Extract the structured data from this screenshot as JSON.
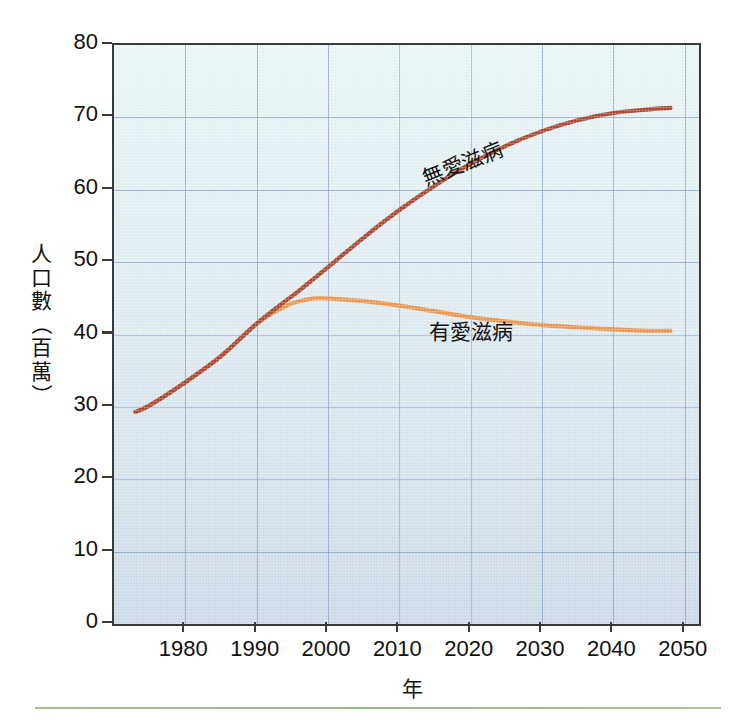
{
  "chart_data": {
    "type": "line",
    "title": "",
    "xlabel": "年",
    "ylabel": "人口數（百萬）",
    "xlim": [
      1973,
      2050
    ],
    "ylim": [
      0,
      80
    ],
    "xticks": [
      "1980",
      "1990",
      "2000",
      "2010",
      "2020",
      "2030",
      "2040",
      "2050"
    ],
    "yticks": [
      "0",
      "10",
      "20",
      "30",
      "40",
      "50",
      "60",
      "70",
      "80"
    ],
    "grid": true,
    "legend_position": "inline-annotation",
    "series": [
      {
        "name": "無愛滋病",
        "color": "#a8452f",
        "x": [
          1973,
          1975,
          1980,
          1985,
          1990,
          1994,
          1996,
          2000,
          2005,
          2010,
          2015,
          2020,
          2025,
          2030,
          2035,
          2040,
          2045,
          2048
        ],
        "values": [
          29.3,
          30.2,
          33.4,
          37.0,
          41.5,
          44.6,
          46.1,
          49.3,
          53.4,
          57.2,
          60.6,
          63.6,
          66.1,
          68.1,
          69.6,
          70.6,
          71.1,
          71.3
        ]
      },
      {
        "name": "有愛滋病",
        "color": "#e8954e",
        "x": [
          1973,
          1975,
          1980,
          1985,
          1990,
          1994,
          1996,
          1998,
          2000,
          2005,
          2010,
          2015,
          2020,
          2025,
          2030,
          2035,
          2040,
          2045,
          2048
        ],
        "values": [
          29.3,
          30.2,
          33.4,
          37.0,
          41.5,
          43.9,
          44.6,
          45.0,
          45.0,
          44.6,
          44.0,
          43.2,
          42.4,
          41.8,
          41.3,
          41.0,
          40.7,
          40.5,
          40.5
        ]
      }
    ],
    "annotations": [
      {
        "text": "無愛滋病",
        "series": "無愛滋病",
        "rotation_deg": -22
      },
      {
        "text": "有愛滋病",
        "series": "有愛滋病",
        "rotation_deg": 0
      }
    ],
    "axis_y_chars": [
      "人",
      "口",
      "數",
      "（",
      "百",
      "萬",
      "）"
    ],
    "colors": {
      "no_aids_line": "#a8452f",
      "with_aids_line": "#e8954e",
      "grid": "#7e9cc4",
      "axis": "#3a3a3a",
      "plot_bg_top": "#e8f4f5",
      "plot_bg_bottom": "#cbd8e6",
      "bottom_rule": "#9dbf86"
    }
  }
}
